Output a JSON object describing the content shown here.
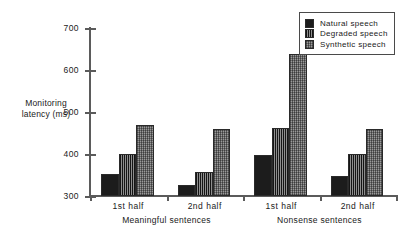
{
  "chart_data": {
    "type": "bar",
    "title": "",
    "xlabel": "",
    "ylabel": "Monitoring latency (ms)",
    "ylabel_line1": "Monitoring",
    "ylabel_line2": "latency (ms)",
    "ylim": [
      300,
      700
    ],
    "yticks": [
      300,
      400,
      500,
      600,
      700
    ],
    "ytick_labels": [
      "300",
      "400",
      "500",
      "600",
      "700"
    ],
    "grid": false,
    "legend_position": "top-right",
    "categories": [
      "1st half",
      "2nd half",
      "1st half",
      "2nd half"
    ],
    "group_labels": [
      "Meaningful sentences",
      "Nonsense sentences"
    ],
    "series": [
      {
        "name": "Natural speech",
        "values": [
          352,
          327,
          398,
          347
        ]
      },
      {
        "name": "Degraded speech",
        "values": [
          401,
          358,
          461,
          401
        ]
      },
      {
        "name": "Synthetic speech",
        "values": [
          470,
          460,
          638,
          460
        ]
      }
    ],
    "colors": {
      "natural": "#1c1c1c",
      "degraded": "#555555",
      "synthetic": "#9a9a9a",
      "axis": "#5b5b5b",
      "background": "#ffffff"
    }
  },
  "legend": {
    "items": [
      {
        "label": "Natural speech",
        "swatch": "solid-black-swatch"
      },
      {
        "label": "Degraded speech",
        "swatch": "vertical-striped-swatch"
      },
      {
        "label": "Synthetic speech",
        "swatch": "speckled-gray-swatch"
      }
    ]
  }
}
